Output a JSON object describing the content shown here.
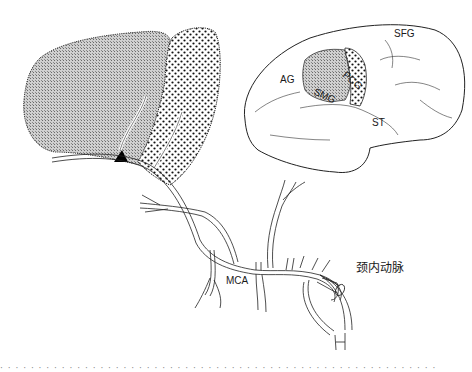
{
  "figure": {
    "type": "anatomical-diagram",
    "labels": {
      "SFG": "SFG",
      "PCG": "PCG",
      "AG": "AG",
      "SMG": "SMG",
      "ST": "ST",
      "MCA": "MCA",
      "ica": "颈内动脉"
    },
    "colors": {
      "line": "#1a1a1a",
      "shade": "#b8b8b8",
      "dots": "#111111",
      "background": "#ffffff"
    }
  },
  "caption": {
    "text": "· · · · · · · · · · · · · · · · · · · · · · · · · · · · · · · · · · · · · · · · · · · · · · · · · · · · · · · · ·"
  }
}
